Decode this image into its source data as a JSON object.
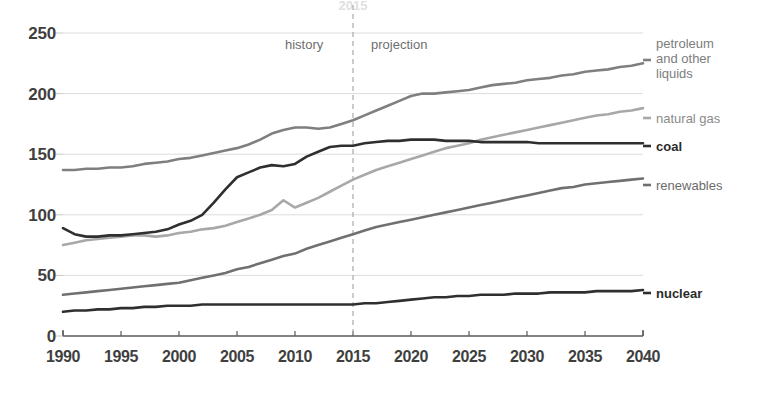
{
  "chart_data": {
    "type": "line",
    "title": "",
    "subtitle": "",
    "xlabel": "",
    "ylabel": "",
    "xlim": [
      1990,
      2040
    ],
    "ylim": [
      0,
      250
    ],
    "grid": true,
    "legend_position": "right-inline",
    "x_ticks": [
      "1990",
      "1995",
      "2000",
      "2005",
      "2010",
      "2015",
      "2020",
      "2025",
      "2030",
      "2035",
      "2040"
    ],
    "y_ticks": [
      "0",
      "50",
      "100",
      "150",
      "200",
      "250"
    ],
    "annotations": {
      "history": "history",
      "projection": "projection",
      "divider_year": "2015"
    },
    "x": [
      1990,
      1991,
      1992,
      1993,
      1994,
      1995,
      1996,
      1997,
      1998,
      1999,
      2000,
      2001,
      2002,
      2003,
      2004,
      2005,
      2006,
      2007,
      2008,
      2009,
      2010,
      2011,
      2012,
      2013,
      2014,
      2015,
      2016,
      2017,
      2018,
      2019,
      2020,
      2021,
      2022,
      2023,
      2024,
      2025,
      2026,
      2027,
      2028,
      2029,
      2030,
      2031,
      2032,
      2033,
      2034,
      2035,
      2036,
      2037,
      2038,
      2039,
      2040
    ],
    "series": [
      {
        "name": "petroleum and other liquids",
        "label": "petroleum\nand other\nliquids",
        "color": "#7f7f7f",
        "values": [
          137,
          137,
          138,
          138,
          139,
          139,
          140,
          142,
          143,
          144,
          146,
          147,
          149,
          151,
          153,
          155,
          158,
          162,
          167,
          170,
          172,
          172,
          171,
          172,
          175,
          178,
          182,
          186,
          190,
          194,
          198,
          200,
          200,
          201,
          202,
          203,
          205,
          207,
          208,
          209,
          211,
          212,
          213,
          215,
          216,
          218,
          219,
          220,
          222,
          223,
          225
        ]
      },
      {
        "name": "natural gas",
        "label": "natural gas",
        "color": "#a8a8a8",
        "values": [
          75,
          77,
          79,
          80,
          81,
          82,
          83,
          83,
          82,
          83,
          85,
          86,
          88,
          89,
          91,
          94,
          97,
          100,
          104,
          112,
          106,
          110,
          114,
          119,
          124,
          129,
          133,
          137,
          140,
          143,
          146,
          149,
          152,
          155,
          157,
          159,
          162,
          164,
          166,
          168,
          170,
          172,
          174,
          176,
          178,
          180,
          182,
          183,
          185,
          186,
          188
        ]
      },
      {
        "name": "coal",
        "label": "coal",
        "color": "#2f2f2f",
        "values": [
          89,
          84,
          82,
          82,
          83,
          83,
          84,
          85,
          86,
          88,
          92,
          95,
          100,
          110,
          121,
          131,
          135,
          139,
          141,
          140,
          142,
          148,
          152,
          156,
          157,
          157,
          159,
          160,
          161,
          161,
          162,
          162,
          162,
          161,
          161,
          161,
          160,
          160,
          160,
          160,
          160,
          159,
          159,
          159,
          159,
          159,
          159,
          159,
          159,
          159,
          159
        ]
      },
      {
        "name": "renewables",
        "label": "renewables",
        "color": "#707070",
        "values": [
          34,
          35,
          36,
          37,
          38,
          39,
          40,
          41,
          42,
          43,
          44,
          46,
          48,
          50,
          52,
          55,
          57,
          60,
          63,
          66,
          68,
          72,
          75,
          78,
          81,
          84,
          87,
          90,
          92,
          94,
          96,
          98,
          100,
          102,
          104,
          106,
          108,
          110,
          112,
          114,
          116,
          118,
          120,
          122,
          123,
          125,
          126,
          127,
          128,
          129,
          130
        ]
      },
      {
        "name": "nuclear",
        "label": "nuclear",
        "color": "#2f2f2f",
        "values": [
          20,
          21,
          21,
          22,
          22,
          23,
          23,
          24,
          24,
          25,
          25,
          25,
          26,
          26,
          26,
          26,
          26,
          26,
          26,
          26,
          26,
          26,
          26,
          26,
          26,
          26,
          27,
          27,
          28,
          29,
          30,
          31,
          32,
          32,
          33,
          33,
          34,
          34,
          34,
          35,
          35,
          35,
          36,
          36,
          36,
          36,
          37,
          37,
          37,
          37,
          38
        ]
      }
    ]
  },
  "axes": {
    "plot_left": 63,
    "plot_right": 643,
    "plot_top": 33,
    "plot_bottom": 336,
    "divider_x_value": 2015
  },
  "labels": {
    "petroleum_line1": "petroleum",
    "petroleum_line2": "and other",
    "petroleum_line3": "liquids",
    "natural_gas": "natural gas",
    "coal": "coal",
    "renewables": "renewables",
    "nuclear": "nuclear"
  }
}
